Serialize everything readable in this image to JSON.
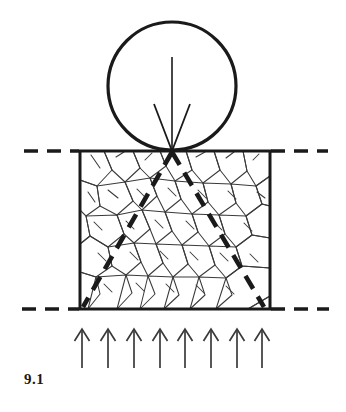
{
  "figure": {
    "caption": "9.1",
    "colors": {
      "ink": "#1a1a1a",
      "grain": "#3a3a3a",
      "background": "#ffffff"
    },
    "elements": {
      "indenter_label": "spherical indenter",
      "specimen_label": "cracked brittle specimen",
      "ground_line_label": "surface datum line",
      "load_arrow_label": "applied load",
      "reaction_arrows_label": "reaction load",
      "crack_cone_label": "cone crack"
    },
    "geometry": {
      "circle": {
        "cx": 172,
        "cy": 86,
        "r": 64,
        "stroke_width": 3.2
      },
      "box": {
        "x": 80,
        "y": 151,
        "width": 190,
        "height": 158,
        "stroke_width": 3
      },
      "load_arrow": {
        "x": 172,
        "y_start": 57,
        "y_end": 151,
        "barb_half_width": 18,
        "barb_y": 104
      },
      "ground_left_dash": {
        "x_start": 24,
        "x_end": 79,
        "y": 151
      },
      "ground_right_dash": {
        "x_start": 271,
        "x_end": 328,
        "y": 151
      },
      "base_left_dash": {
        "x_start": 22,
        "x_end": 79,
        "y": 309
      },
      "base_right_dash": {
        "x_start": 271,
        "x_end": 329,
        "y": 309
      },
      "cone_crack_left": {
        "x1": 172,
        "y1": 152,
        "x2": 83,
        "y2": 307
      },
      "cone_crack_right": {
        "x1": 172,
        "y1": 152,
        "x2": 264,
        "y2": 307
      },
      "reaction_arrows": {
        "count": 8,
        "x_positions": [
          82,
          108,
          134,
          160,
          185,
          211,
          237,
          262
        ],
        "y_tail": 368,
        "y_head": 329,
        "barb_half_width": 7.5,
        "barb_y": 341
      }
    },
    "grain_cells": [
      [
        [
          80,
          151
        ],
        [
          104,
          151
        ],
        [
          112,
          170
        ],
        [
          97,
          186
        ],
        [
          80,
          180
        ]
      ],
      [
        [
          104,
          151
        ],
        [
          133,
          151
        ],
        [
          140,
          168
        ],
        [
          125,
          182
        ],
        [
          112,
          170
        ]
      ],
      [
        [
          133,
          151
        ],
        [
          160,
          151
        ],
        [
          166,
          166
        ],
        [
          150,
          178
        ],
        [
          140,
          168
        ]
      ],
      [
        [
          160,
          151
        ],
        [
          186,
          151
        ],
        [
          192,
          170
        ],
        [
          175,
          181
        ],
        [
          166,
          166
        ]
      ],
      [
        [
          186,
          151
        ],
        [
          214,
          151
        ],
        [
          220,
          170
        ],
        [
          203,
          183
        ],
        [
          192,
          170
        ]
      ],
      [
        [
          214,
          151
        ],
        [
          243,
          151
        ],
        [
          247,
          171
        ],
        [
          231,
          184
        ],
        [
          220,
          170
        ]
      ],
      [
        [
          243,
          151
        ],
        [
          270,
          151
        ],
        [
          270,
          176
        ],
        [
          256,
          186
        ],
        [
          247,
          171
        ]
      ],
      [
        [
          80,
          180
        ],
        [
          97,
          186
        ],
        [
          100,
          206
        ],
        [
          86,
          216
        ],
        [
          80,
          210
        ]
      ],
      [
        [
          97,
          186
        ],
        [
          125,
          182
        ],
        [
          133,
          201
        ],
        [
          117,
          215
        ],
        [
          100,
          206
        ]
      ],
      [
        [
          125,
          182
        ],
        [
          150,
          178
        ],
        [
          157,
          196
        ],
        [
          142,
          210
        ],
        [
          133,
          201
        ]
      ],
      [
        [
          150,
          178
        ],
        [
          175,
          181
        ],
        [
          181,
          199
        ],
        [
          165,
          212
        ],
        [
          157,
          196
        ]
      ],
      [
        [
          175,
          181
        ],
        [
          203,
          183
        ],
        [
          208,
          202
        ],
        [
          192,
          214
        ],
        [
          181,
          199
        ]
      ],
      [
        [
          203,
          183
        ],
        [
          231,
          184
        ],
        [
          236,
          203
        ],
        [
          219,
          215
        ],
        [
          208,
          202
        ]
      ],
      [
        [
          231,
          184
        ],
        [
          256,
          186
        ],
        [
          262,
          204
        ],
        [
          246,
          216
        ],
        [
          236,
          203
        ]
      ],
      [
        [
          256,
          186
        ],
        [
          270,
          176
        ],
        [
          270,
          206
        ],
        [
          262,
          204
        ]
      ],
      [
        [
          80,
          210
        ],
        [
          86,
          216
        ],
        [
          90,
          236
        ],
        [
          80,
          244
        ]
      ],
      [
        [
          86,
          216
        ],
        [
          117,
          215
        ],
        [
          124,
          234
        ],
        [
          108,
          247
        ],
        [
          90,
          236
        ]
      ],
      [
        [
          117,
          215
        ],
        [
          142,
          210
        ],
        [
          150,
          229
        ],
        [
          134,
          243
        ],
        [
          124,
          234
        ]
      ],
      [
        [
          142,
          210
        ],
        [
          165,
          212
        ],
        [
          172,
          231
        ],
        [
          156,
          244
        ],
        [
          150,
          229
        ]
      ],
      [
        [
          165,
          212
        ],
        [
          192,
          214
        ],
        [
          198,
          232
        ],
        [
          182,
          245
        ],
        [
          172,
          231
        ]
      ],
      [
        [
          192,
          214
        ],
        [
          219,
          215
        ],
        [
          225,
          234
        ],
        [
          209,
          246
        ],
        [
          198,
          232
        ]
      ],
      [
        [
          219,
          215
        ],
        [
          246,
          216
        ],
        [
          252,
          235
        ],
        [
          236,
          247
        ],
        [
          225,
          234
        ]
      ],
      [
        [
          246,
          216
        ],
        [
          262,
          204
        ],
        [
          270,
          206
        ],
        [
          270,
          238
        ],
        [
          252,
          235
        ]
      ],
      [
        [
          80,
          244
        ],
        [
          90,
          236
        ],
        [
          108,
          247
        ],
        [
          112,
          266
        ],
        [
          96,
          277
        ],
        [
          80,
          272
        ]
      ],
      [
        [
          108,
          247
        ],
        [
          134,
          243
        ],
        [
          141,
          262
        ],
        [
          126,
          275
        ],
        [
          112,
          266
        ]
      ],
      [
        [
          134,
          243
        ],
        [
          156,
          244
        ],
        [
          163,
          263
        ],
        [
          148,
          276
        ],
        [
          141,
          262
        ]
      ],
      [
        [
          156,
          244
        ],
        [
          182,
          245
        ],
        [
          188,
          264
        ],
        [
          173,
          277
        ],
        [
          163,
          263
        ]
      ],
      [
        [
          182,
          245
        ],
        [
          209,
          246
        ],
        [
          215,
          265
        ],
        [
          199,
          277
        ],
        [
          188,
          264
        ]
      ],
      [
        [
          209,
          246
        ],
        [
          236,
          247
        ],
        [
          242,
          266
        ],
        [
          226,
          278
        ],
        [
          215,
          265
        ]
      ],
      [
        [
          236,
          247
        ],
        [
          252,
          235
        ],
        [
          270,
          238
        ],
        [
          270,
          268
        ],
        [
          242,
          266
        ]
      ],
      [
        [
          80,
          272
        ],
        [
          96,
          277
        ],
        [
          100,
          294
        ],
        [
          88,
          309
        ],
        [
          80,
          309
        ]
      ],
      [
        [
          96,
          277
        ],
        [
          126,
          275
        ],
        [
          132,
          293
        ],
        [
          117,
          309
        ],
        [
          88,
          309
        ]
      ],
      [
        [
          126,
          275
        ],
        [
          148,
          276
        ],
        [
          155,
          294
        ],
        [
          140,
          309
        ],
        [
          117,
          309
        ]
      ],
      [
        [
          148,
          276
        ],
        [
          173,
          277
        ],
        [
          179,
          295
        ],
        [
          164,
          309
        ],
        [
          140,
          309
        ]
      ],
      [
        [
          173,
          277
        ],
        [
          199,
          277
        ],
        [
          205,
          295
        ],
        [
          190,
          309
        ],
        [
          164,
          309
        ]
      ],
      [
        [
          199,
          277
        ],
        [
          226,
          278
        ],
        [
          232,
          295
        ],
        [
          216,
          309
        ],
        [
          190,
          309
        ]
      ],
      [
        [
          226,
          278
        ],
        [
          242,
          266
        ],
        [
          270,
          268
        ],
        [
          270,
          296
        ],
        [
          248,
          309
        ],
        [
          216,
          309
        ]
      ],
      [
        [
          270,
          296
        ],
        [
          270,
          309
        ],
        [
          248,
          309
        ]
      ]
    ],
    "grain_detail_lines": [
      [
        [
          91,
          155
        ],
        [
          100,
          168
        ]
      ],
      [
        [
          116,
          157
        ],
        [
          124,
          152
        ]
      ],
      [
        [
          145,
          160
        ],
        [
          152,
          153
        ]
      ],
      [
        [
          196,
          157
        ],
        [
          205,
          152
        ]
      ],
      [
        [
          226,
          158
        ],
        [
          234,
          152
        ]
      ],
      [
        [
          253,
          160
        ],
        [
          259,
          154
        ]
      ],
      [
        [
          88,
          192
        ],
        [
          95,
          202
        ]
      ],
      [
        [
          108,
          190
        ],
        [
          118,
          198
        ]
      ],
      [
        [
          137,
          189
        ],
        [
          145,
          197
        ]
      ],
      [
        [
          168,
          188
        ],
        [
          176,
          196
        ]
      ],
      [
        [
          198,
          190
        ],
        [
          206,
          198
        ]
      ],
      [
        [
          228,
          191
        ],
        [
          236,
          199
        ]
      ],
      [
        [
          257,
          192
        ],
        [
          265,
          198
        ]
      ],
      [
        [
          94,
          222
        ],
        [
          102,
          230
        ]
      ],
      [
        [
          126,
          221
        ],
        [
          134,
          229
        ]
      ],
      [
        [
          155,
          220
        ],
        [
          163,
          228
        ]
      ],
      [
        [
          186,
          221
        ],
        [
          194,
          229
        ]
      ],
      [
        [
          214,
          222
        ],
        [
          222,
          230
        ]
      ],
      [
        [
          244,
          223
        ],
        [
          252,
          231
        ]
      ],
      [
        [
          98,
          253
        ],
        [
          106,
          261
        ]
      ],
      [
        [
          130,
          252
        ],
        [
          138,
          260
        ]
      ],
      [
        [
          160,
          251
        ],
        [
          168,
          259
        ]
      ],
      [
        [
          190,
          252
        ],
        [
          198,
          260
        ]
      ],
      [
        [
          220,
          253
        ],
        [
          228,
          261
        ]
      ],
      [
        [
          250,
          254
        ],
        [
          258,
          262
        ]
      ],
      [
        [
          104,
          284
        ],
        [
          112,
          292
        ]
      ],
      [
        [
          136,
          283
        ],
        [
          144,
          291
        ]
      ],
      [
        [
          166,
          284
        ],
        [
          174,
          292
        ]
      ],
      [
        [
          196,
          285
        ],
        [
          204,
          293
        ]
      ],
      [
        [
          226,
          286
        ],
        [
          234,
          294
        ]
      ]
    ]
  }
}
